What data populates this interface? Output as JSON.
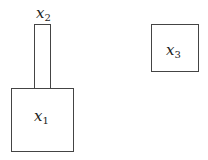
{
  "diagram": {
    "shapes": [
      {
        "id": "x1",
        "label_var": "x",
        "label_sub": "1",
        "kind": "rectangle",
        "description": "large square bottom-left"
      },
      {
        "id": "x2",
        "label_var": "x",
        "label_sub": "2",
        "kind": "rectangle",
        "description": "tall narrow rectangle atop x1, label above"
      },
      {
        "id": "x3",
        "label_var": "x",
        "label_sub": "3",
        "kind": "rectangle",
        "description": "square at top-right"
      }
    ],
    "colors": {
      "stroke": "#444444",
      "background": "#ffffff",
      "text": "#222222"
    }
  }
}
